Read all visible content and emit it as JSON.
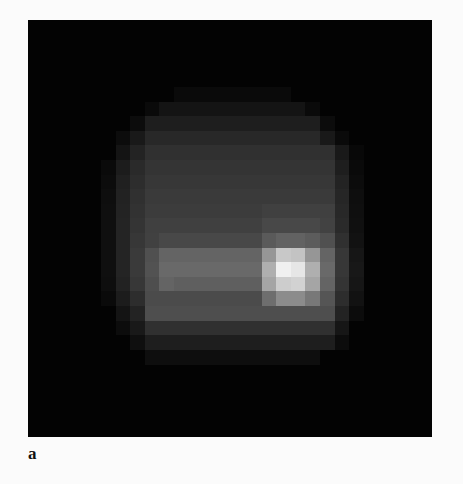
{
  "figure": {
    "panel_label": "a",
    "image": {
      "description": "pixelated grayscale intensity map",
      "grid": {
        "cols": 28,
        "rows": 29,
        "cell_px": 14.6,
        "background_level": 4,
        "rows_data": [
          {
            "r": 0,
            "cells": {}
          },
          {
            "r": 1,
            "cells": {}
          },
          {
            "r": 2,
            "cells": {}
          },
          {
            "r": 3,
            "cells": {}
          },
          {
            "r": 4,
            "cells": {}
          },
          {
            "r": 5,
            "cells": {
              "10-17": 10
            }
          },
          {
            "r": 6,
            "cells": {
              "8": 10,
              "9-18": 20,
              "19": 10
            }
          },
          {
            "r": 7,
            "cells": {
              "7": 12,
              "8-19": 30,
              "20": 12
            }
          },
          {
            "r": 8,
            "cells": {
              "6": 12,
              "7": 25,
              "8-19": 40,
              "20": 25,
              "21": 10
            }
          },
          {
            "r": 9,
            "cells": {
              "6": 20,
              "7": 35,
              "8-20": 48,
              "21": 25,
              "22": 8
            }
          },
          {
            "r": 10,
            "cells": {
              "5": 10,
              "6": 28,
              "7": 42,
              "8-20": 52,
              "21": 30,
              "22": 10
            }
          },
          {
            "r": 11,
            "cells": {
              "5": 12,
              "6": 32,
              "7": 45,
              "8-20": 55,
              "21": 35,
              "22": 12
            }
          },
          {
            "r": 12,
            "cells": {
              "5": 14,
              "6": 34,
              "7": 48,
              "8-20": 58,
              "21": 38,
              "22": 14
            }
          },
          {
            "r": 13,
            "cells": {
              "5": 15,
              "6": 35,
              "7": 50,
              "8-15": 60,
              "16-20": 64,
              "21": 40,
              "22": 15
            }
          },
          {
            "r": 14,
            "cells": {
              "5": 15,
              "6": 36,
              "7": 52,
              "8-15": 64,
              "16-19": 72,
              "20": 66,
              "21": 42,
              "22": 16
            }
          },
          {
            "r": 15,
            "cells": {
              "5": 15,
              "6": 36,
              "7": 55,
              "8": 65,
              "9-15": 72,
              "16": 90,
              "17": 98,
              "18": 98,
              "19": 92,
              "20": 80,
              "21": 48,
              "22": 18
            }
          },
          {
            "r": 16,
            "cells": {
              "5": 15,
              "6": 36,
              "7": 58,
              "8": 80,
              "9-15": 100,
              "16": 150,
              "17": 200,
              "18": 195,
              "19": 150,
              "20": 100,
              "21": 55,
              "22": 22
            }
          },
          {
            "r": 17,
            "cells": {
              "5": 15,
              "6": 36,
              "7": 58,
              "8": 82,
              "9-15": 105,
              "16": 175,
              "17": 240,
              "18": 230,
              "19": 175,
              "20": 105,
              "21": 55,
              "22": 24
            }
          },
          {
            "r": 18,
            "cells": {
              "5": 14,
              "6": 34,
              "7": 55,
              "8": 78,
              "9": 100,
              "10-15": 95,
              "16": 165,
              "17": 205,
              "18": 210,
              "19": 165,
              "20": 100,
              "21": 52,
              "22": 22
            }
          },
          {
            "r": 19,
            "cells": {
              "5": 10,
              "6": 28,
              "7": 45,
              "8-15": 75,
              "16": 110,
              "17": 140,
              "18": 140,
              "19": 120,
              "20": 85,
              "21": 45,
              "22": 18
            }
          },
          {
            "r": 20,
            "cells": {
              "6": 20,
              "7": 35,
              "8-20": 78,
              "21": 35,
              "22": 12
            }
          },
          {
            "r": 21,
            "cells": {
              "6": 12,
              "7": 25,
              "8-20": 48,
              "21": 22
            }
          },
          {
            "r": 22,
            "cells": {
              "7": 15,
              "8-20": 30,
              "21": 12
            }
          },
          {
            "r": 23,
            "cells": {
              "8-19": 14
            }
          },
          {
            "r": 24,
            "cells": {}
          },
          {
            "r": 25,
            "cells": {}
          },
          {
            "r": 26,
            "cells": {}
          },
          {
            "r": 27,
            "cells": {}
          },
          {
            "r": 28,
            "cells": {}
          }
        ]
      }
    }
  }
}
